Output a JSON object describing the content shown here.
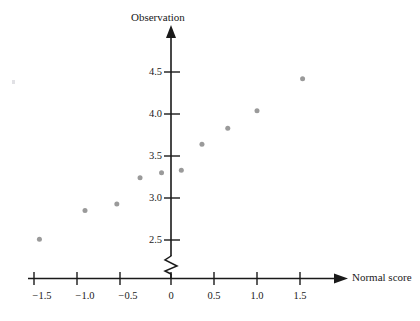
{
  "chart_data": {
    "type": "scatter",
    "title": "",
    "xlabel": "Normal score",
    "ylabel": "Observation",
    "xlim": [
      -1.75,
      1.85
    ],
    "ylim": [
      2.35,
      4.72
    ],
    "grid": false,
    "legend": null,
    "y_axis_break": true,
    "y_axis_break_note": "zigzag break on vertical axis below 2.5",
    "xticks": [
      -1.5,
      -1.0,
      -0.5,
      0,
      0.5,
      1.0,
      1.5
    ],
    "xtick_labels": [
      "−1.5",
      "−1.0",
      "−0.5",
      "0",
      "0.5",
      "1.0",
      "1.5"
    ],
    "yticks": [
      2.5,
      3.0,
      3.5,
      4.0,
      4.5
    ],
    "ytick_labels": [
      "2.5",
      "3.0",
      "3.5",
      "4.0",
      "4.5"
    ],
    "marker": "circle",
    "marker_color": "#9a9a9a",
    "marker_size_px": 5,
    "points": [
      {
        "x": -1.53,
        "y": 2.51
      },
      {
        "x": -1.0,
        "y": 2.85
      },
      {
        "x": -0.63,
        "y": 2.93
      },
      {
        "x": -0.36,
        "y": 3.24
      },
      {
        "x": -0.11,
        "y": 3.3
      },
      {
        "x": 0.12,
        "y": 3.33
      },
      {
        "x": 0.36,
        "y": 3.64
      },
      {
        "x": 0.66,
        "y": 3.83
      },
      {
        "x": 1.0,
        "y": 4.04
      },
      {
        "x": 1.53,
        "y": 4.42
      }
    ]
  },
  "axes": {
    "x_title": "Normal score",
    "y_title": "Observation"
  },
  "colors": {
    "marker": "#9a9a9a",
    "axis": "#1a1a1a",
    "text": "#1a1a1a"
  }
}
